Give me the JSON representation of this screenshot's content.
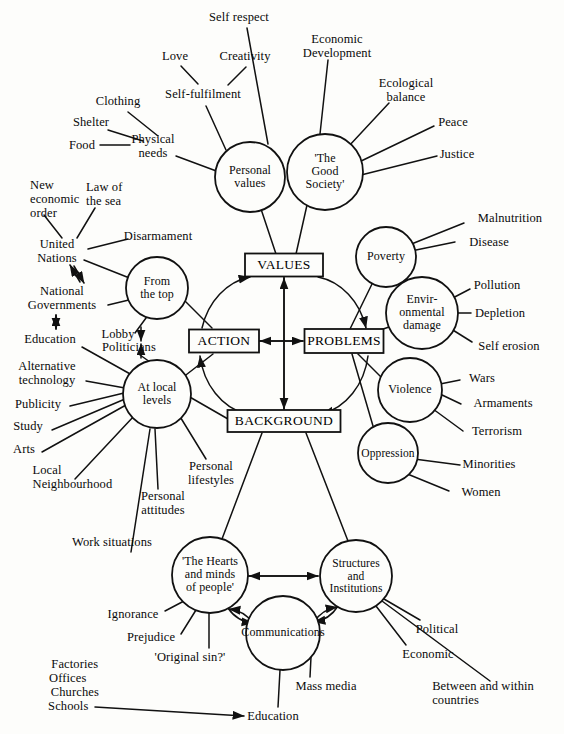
{
  "diagram": {
    "type": "concept-map",
    "title": "",
    "core_boxes": [
      {
        "id": "values",
        "label": "VALUES",
        "cx": 284,
        "cy": 265,
        "w": 78,
        "h": 23
      },
      {
        "id": "action",
        "label": "ACTION",
        "cx": 224,
        "cy": 341,
        "w": 70,
        "h": 23
      },
      {
        "id": "problems",
        "label": "PROBLEMS",
        "cx": 344,
        "cy": 341,
        "w": 79,
        "h": 24
      },
      {
        "id": "background",
        "label": "BACKGROUND",
        "cx": 284,
        "cy": 421,
        "w": 113,
        "h": 22
      }
    ],
    "nodes": [
      {
        "id": "personal-values",
        "label": "Personal\nvalues",
        "cx": 250,
        "cy": 177,
        "r": 35
      },
      {
        "id": "good-society",
        "label": "'The\nGood\nSociety'",
        "cx": 325,
        "cy": 172,
        "r": 38
      },
      {
        "id": "from-the-top",
        "label": "From\nthe top",
        "cx": 157,
        "cy": 288,
        "r": 31
      },
      {
        "id": "at-local-levels",
        "label": "At local\nlevels",
        "cx": 157,
        "cy": 394,
        "r": 34
      },
      {
        "id": "poverty",
        "label": "Poverty",
        "cx": 386,
        "cy": 257,
        "r": 30
      },
      {
        "id": "environmental",
        "label": "Envir-\nonmental\ndamage",
        "cx": 422,
        "cy": 313,
        "r": 36
      },
      {
        "id": "violence",
        "label": "Violence",
        "cx": 410,
        "cy": 390,
        "r": 32
      },
      {
        "id": "oppression",
        "label": "Oppression",
        "cx": 388,
        "cy": 453,
        "r": 30
      },
      {
        "id": "hearts-and-minds",
        "label": "'The Hearts\nand minds\nof people'",
        "cx": 210,
        "cy": 575,
        "r": 38
      },
      {
        "id": "structures",
        "label": "Structures\nand\nInstitutions",
        "cx": 356,
        "cy": 576,
        "r": 36
      },
      {
        "id": "communications",
        "label": "Communications",
        "cx": 283,
        "cy": 633,
        "r": 37
      }
    ],
    "leaf_labels": [
      {
        "id": "self-respect",
        "text": "Self respect",
        "x": 239,
        "y": 17,
        "align": "c"
      },
      {
        "id": "love",
        "text": "Love",
        "x": 175,
        "y": 56,
        "align": "c"
      },
      {
        "id": "creativity",
        "text": "Creativity",
        "x": 245,
        "y": 56,
        "align": "c"
      },
      {
        "id": "self-fulfilment",
        "text": "Self-fulfilment",
        "x": 203,
        "y": 94,
        "align": "c"
      },
      {
        "id": "clothing",
        "text": "Clothing",
        "x": 118,
        "y": 101,
        "align": "c"
      },
      {
        "id": "shelter",
        "text": "Shelter",
        "x": 91,
        "y": 122,
        "align": "c"
      },
      {
        "id": "food",
        "text": "Food",
        "x": 82,
        "y": 145,
        "align": "c"
      },
      {
        "id": "physical-needs",
        "text": "Physical\nneeds",
        "x": 153,
        "y": 146,
        "align": "c"
      },
      {
        "id": "economic-development",
        "text": "Economic\nDevelopment",
        "x": 337,
        "y": 46,
        "align": "c"
      },
      {
        "id": "ecological-balance",
        "text": "Ecological\nbalance",
        "x": 406,
        "y": 90,
        "align": "c"
      },
      {
        "id": "peace",
        "text": "Peace",
        "x": 453,
        "y": 122,
        "align": "c"
      },
      {
        "id": "justice",
        "text": "Justice",
        "x": 457,
        "y": 154,
        "align": "c"
      },
      {
        "id": "new-economic-order",
        "text": "New\neconomic\norder",
        "x": 35,
        "y": 199,
        "align": "c"
      },
      {
        "id": "law-of-the-sea",
        "text": "Law of\nthe sea",
        "x": 97,
        "y": 194,
        "align": "c"
      },
      {
        "id": "disarmament",
        "text": "Disarmament",
        "x": 158,
        "y": 236,
        "align": "c"
      },
      {
        "id": "united-nations",
        "text": "United\nNations",
        "x": 57,
        "y": 251,
        "align": "c"
      },
      {
        "id": "national-governments",
        "text": "National\nGovernments",
        "x": 62,
        "y": 298,
        "align": "c"
      },
      {
        "id": "education-left",
        "text": "Education",
        "x": 50,
        "y": 339,
        "align": "c"
      },
      {
        "id": "lobby",
        "text": "Lobby",
        "x": 118,
        "y": 334,
        "align": "c"
      },
      {
        "id": "politicians",
        "text": "Politicians",
        "x": 129,
        "y": 347,
        "align": "c"
      },
      {
        "id": "alternative-tech",
        "text": "Alternative\ntechnology",
        "x": 47,
        "y": 373,
        "align": "c"
      },
      {
        "id": "publicity",
        "text": "Publicity",
        "x": 38,
        "y": 404,
        "align": "c"
      },
      {
        "id": "study",
        "text": "Study",
        "x": 28,
        "y": 426,
        "align": "c"
      },
      {
        "id": "arts",
        "text": "Arts",
        "x": 24,
        "y": 449,
        "align": "c"
      },
      {
        "id": "local-neighbourhood",
        "text": "Local\nNeighbourhood",
        "x": 66,
        "y": 477,
        "align": "c"
      },
      {
        "id": "personal-attitudes",
        "text": "Personal\nattitudes",
        "x": 163,
        "y": 503,
        "align": "c"
      },
      {
        "id": "personal-lifestyles",
        "text": "Personal\nlifestyles",
        "x": 211,
        "y": 473,
        "align": "c"
      },
      {
        "id": "work-situations",
        "text": "Work situations",
        "x": 112,
        "y": 542,
        "align": "c"
      },
      {
        "id": "factories",
        "text": "Factories",
        "x": 71,
        "y": 664,
        "align": "c"
      },
      {
        "id": "offices",
        "text": "Offices",
        "x": 64,
        "y": 678,
        "align": "c"
      },
      {
        "id": "churches",
        "text": "Churches",
        "x": 71,
        "y": 692,
        "align": "c"
      },
      {
        "id": "schools",
        "text": "Schools",
        "x": 65,
        "y": 706,
        "align": "c"
      },
      {
        "id": "malnutrition",
        "text": "Malnutrition",
        "x": 510,
        "y": 218,
        "align": "c"
      },
      {
        "id": "disease",
        "text": "Disease",
        "x": 489,
        "y": 242,
        "align": "c"
      },
      {
        "id": "pollution",
        "text": "Pollution",
        "x": 497,
        "y": 285,
        "align": "c"
      },
      {
        "id": "depletion",
        "text": "Depletion",
        "x": 500,
        "y": 313,
        "align": "c"
      },
      {
        "id": "self-erosion",
        "text": "Self erosion",
        "x": 509,
        "y": 346,
        "align": "c"
      },
      {
        "id": "wars",
        "text": "Wars",
        "x": 482,
        "y": 378,
        "align": "c"
      },
      {
        "id": "armaments",
        "text": "Armaments",
        "x": 503,
        "y": 403,
        "align": "c"
      },
      {
        "id": "terrorism",
        "text": "Terrorism",
        "x": 497,
        "y": 431,
        "align": "c"
      },
      {
        "id": "minorities",
        "text": "Minorities",
        "x": 489,
        "y": 464,
        "align": "c"
      },
      {
        "id": "women",
        "text": "Women",
        "x": 481,
        "y": 492,
        "align": "c"
      },
      {
        "id": "ignorance",
        "text": "Ignorance",
        "x": 133,
        "y": 614,
        "align": "c"
      },
      {
        "id": "prejudice",
        "text": "Prejudice",
        "x": 151,
        "y": 637,
        "align": "c"
      },
      {
        "id": "original-sin",
        "text": "'Original sin?'",
        "x": 190,
        "y": 657,
        "align": "c"
      },
      {
        "id": "mass-media",
        "text": "Mass media",
        "x": 326,
        "y": 686,
        "align": "c"
      },
      {
        "id": "education-bottom",
        "text": "Education",
        "x": 273,
        "y": 716,
        "align": "c"
      },
      {
        "id": "political",
        "text": "Political",
        "x": 437,
        "y": 629,
        "align": "c"
      },
      {
        "id": "economic",
        "text": "Economic",
        "x": 428,
        "y": 654,
        "align": "c"
      },
      {
        "id": "between-within",
        "text": "Between and within\ncountries",
        "x": 481,
        "y": 693,
        "align": "c"
      }
    ],
    "colors": {
      "stroke": "#111111",
      "text": "#0a0a0a",
      "background": "#fdfdfb"
    }
  }
}
